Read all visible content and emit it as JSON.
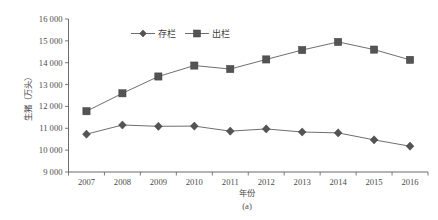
{
  "chart_data": {
    "type": "line",
    "title": "",
    "subtitle": "",
    "caption": "(a)",
    "xlabel": "年份",
    "ylabel": "生猪（万头）",
    "categories": [
      "2007",
      "2008",
      "2009",
      "2010",
      "2011",
      "2012",
      "2013",
      "2014",
      "2015",
      "2016"
    ],
    "x": [
      2007,
      2008,
      2009,
      2010,
      2011,
      2012,
      2013,
      2014,
      2015,
      2016
    ],
    "xlim": [
      2006.5,
      2016.5
    ],
    "ylim": [
      9000,
      16000
    ],
    "ytick_step": 1000,
    "ytick_labels": [
      "9 000",
      "10 000",
      "11 000",
      "12 000",
      "13 000",
      "14 000",
      "15 000",
      "16 000"
    ],
    "ytick_values": [
      9000,
      10000,
      11000,
      12000,
      13000,
      14000,
      15000,
      16000
    ],
    "xtick_labels": [
      "2007",
      "2008",
      "2009",
      "2010",
      "2011",
      "2012",
      "2013",
      "2014",
      "2015",
      "2016"
    ],
    "grid": false,
    "legend_position": "top-center",
    "series": [
      {
        "name": "存栏",
        "marker": "diamond",
        "color": "#545454",
        "values": [
          10730,
          11150,
          11090,
          11100,
          10870,
          10970,
          10830,
          10790,
          10470,
          10180
        ]
      },
      {
        "name": "出栏",
        "marker": "square",
        "color": "#545454",
        "values": [
          11780,
          12600,
          13370,
          13870,
          13710,
          14150,
          14580,
          14950,
          14600,
          14130
        ]
      }
    ]
  },
  "colors": {
    "axis": "#5a5a5a",
    "text": "#4a4a4a",
    "series": "#545454",
    "background": "#ffffff"
  }
}
